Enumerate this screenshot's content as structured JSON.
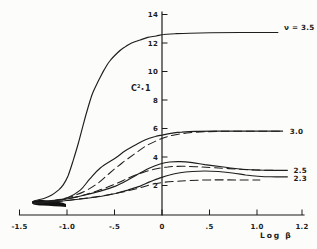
{
  "chart_data": {
    "type": "line",
    "title": "",
    "xlabel": "Log β",
    "ylabel": "C²•1",
    "ylabel_parts": {
      "base": "C",
      "exp": "2",
      "dot": "•",
      "suffix": "1"
    },
    "xlim": [
      -1.5,
      1.45
    ],
    "ylim": [
      0,
      14
    ],
    "grid": "off",
    "legend_position": "right-edge-labels",
    "line_color": "#1e1e1e",
    "x_ticks": [
      {
        "label": "-1.5",
        "value": -1.5
      },
      {
        "label": "-1.0",
        "value": -1.0
      },
      {
        "label": "-.5",
        "value": -0.5
      },
      {
        "label": "0",
        "value": 0
      },
      {
        "label": ".5",
        "value": 0.5
      },
      {
        "label": "1.0",
        "value": 1.0
      },
      {
        "label": "1.2",
        "value": 1.2
      }
    ],
    "y_ticks": [
      {
        "label": "2",
        "value": 2
      },
      {
        "label": "4",
        "value": 4
      },
      {
        "label": "6",
        "value": 6
      },
      {
        "label": "8",
        "value": 8
      },
      {
        "label": "10",
        "value": 10
      },
      {
        "label": "12",
        "value": 12
      },
      {
        "label": "14",
        "value": 14
      }
    ],
    "series": [
      {
        "name": "nu-3.5-solid",
        "label": "ν = 3.5",
        "style": "solid",
        "label_dx": 6,
        "label_dy": -2,
        "points": [
          [
            -1.35,
            0.91
          ],
          [
            -1.23,
            1.12
          ],
          [
            -1.16,
            1.33
          ],
          [
            -1.09,
            1.68
          ],
          [
            -1.04,
            2.04
          ],
          [
            -0.99,
            2.67
          ],
          [
            -0.94,
            3.65
          ],
          [
            -0.88,
            4.98
          ],
          [
            -0.83,
            6.25
          ],
          [
            -0.78,
            7.44
          ],
          [
            -0.73,
            8.49
          ],
          [
            -0.67,
            9.33
          ],
          [
            -0.61,
            10.11
          ],
          [
            -0.55,
            10.74
          ],
          [
            -0.47,
            11.3
          ],
          [
            -0.4,
            11.68
          ],
          [
            -0.32,
            12.0
          ],
          [
            -0.23,
            12.21
          ],
          [
            -0.15,
            12.39
          ],
          [
            -0.06,
            12.49
          ],
          [
            0.02,
            12.6
          ],
          [
            0.14,
            12.65
          ],
          [
            0.29,
            12.69
          ],
          [
            0.51,
            12.72
          ],
          [
            0.82,
            12.74
          ],
          [
            1.22,
            12.74
          ]
        ]
      },
      {
        "name": "nu-3.0-solid",
        "label": "3.0",
        "style": "solid",
        "label_dx": 7,
        "label_dy": 3,
        "points": [
          [
            -1.35,
            0.77
          ],
          [
            -1.18,
            0.91
          ],
          [
            -1.0,
            1.12
          ],
          [
            -0.86,
            1.68
          ],
          [
            -0.76,
            2.46
          ],
          [
            -0.65,
            3.23
          ],
          [
            -0.49,
            3.93
          ],
          [
            -0.39,
            4.42
          ],
          [
            -0.28,
            4.84
          ],
          [
            -0.18,
            5.19
          ],
          [
            -0.07,
            5.44
          ],
          [
            0.0,
            5.54
          ],
          [
            0.11,
            5.68
          ],
          [
            0.21,
            5.75
          ],
          [
            0.35,
            5.8
          ],
          [
            0.56,
            5.82
          ],
          [
            1.27,
            5.82
          ]
        ]
      },
      {
        "name": "nu-3.0-dashed",
        "label": "",
        "style": "dashed",
        "points": [
          [
            -1.28,
            0.77
          ],
          [
            -1.13,
            0.95
          ],
          [
            -0.97,
            1.19
          ],
          [
            -0.81,
            1.61
          ],
          [
            -0.67,
            2.18
          ],
          [
            -0.55,
            2.88
          ],
          [
            -0.42,
            3.58
          ],
          [
            -0.29,
            4.21
          ],
          [
            -0.17,
            4.77
          ],
          [
            -0.04,
            5.19
          ],
          [
            0.06,
            5.44
          ],
          [
            0.17,
            5.59
          ],
          [
            0.29,
            5.7
          ],
          [
            0.45,
            5.77
          ],
          [
            0.72,
            5.81
          ],
          [
            1.27,
            5.81
          ]
        ]
      },
      {
        "name": "nu-2.5-solid",
        "label": "2.5",
        "style": "solid",
        "label_dx": 6,
        "label_dy": 2.5,
        "points": [
          [
            -1.35,
            0.77
          ],
          [
            -1.18,
            0.91
          ],
          [
            -1.0,
            1.05
          ],
          [
            -0.81,
            1.33
          ],
          [
            -0.65,
            1.61
          ],
          [
            -0.49,
            1.96
          ],
          [
            -0.36,
            2.39
          ],
          [
            -0.23,
            2.88
          ],
          [
            -0.13,
            3.23
          ],
          [
            -0.02,
            3.51
          ],
          [
            0.08,
            3.65
          ],
          [
            0.19,
            3.68
          ],
          [
            0.32,
            3.61
          ],
          [
            0.45,
            3.47
          ],
          [
            0.61,
            3.33
          ],
          [
            0.77,
            3.19
          ],
          [
            0.93,
            3.1
          ],
          [
            1.08,
            3.07
          ],
          [
            1.32,
            3.07
          ]
        ]
      },
      {
        "name": "nu-2.5-dashed",
        "label": "",
        "style": "dashed",
        "points": [
          [
            -1.23,
            0.84
          ],
          [
            -1.05,
            1.02
          ],
          [
            -0.86,
            1.26
          ],
          [
            -0.67,
            1.65
          ],
          [
            -0.49,
            2.11
          ],
          [
            -0.34,
            2.56
          ],
          [
            -0.2,
            2.91
          ],
          [
            -0.07,
            3.16
          ],
          [
            0.06,
            3.3
          ],
          [
            0.21,
            3.35
          ],
          [
            0.38,
            3.31
          ],
          [
            0.56,
            3.24
          ],
          [
            0.77,
            3.16
          ],
          [
            0.98,
            3.09
          ],
          [
            1.19,
            3.07
          ]
        ]
      },
      {
        "name": "nu-2.3-solid",
        "label": "2.3",
        "style": "solid",
        "label_dx": 6,
        "label_dy": 4,
        "points": [
          [
            -1.35,
            0.74
          ],
          [
            -1.18,
            0.84
          ],
          [
            -1.0,
            0.95
          ],
          [
            -0.81,
            1.09
          ],
          [
            -0.65,
            1.23
          ],
          [
            -0.49,
            1.44
          ],
          [
            -0.36,
            1.68
          ],
          [
            -0.23,
            1.96
          ],
          [
            -0.13,
            2.25
          ],
          [
            -0.02,
            2.53
          ],
          [
            0.08,
            2.74
          ],
          [
            0.19,
            2.89
          ],
          [
            0.32,
            2.98
          ],
          [
            0.45,
            3.02
          ],
          [
            0.59,
            2.98
          ],
          [
            0.74,
            2.88
          ],
          [
            0.88,
            2.74
          ],
          [
            1.01,
            2.65
          ],
          [
            1.14,
            2.61
          ],
          [
            1.32,
            2.61
          ]
        ]
      },
      {
        "name": "nu-2.3-dashed",
        "label": "",
        "style": "dashed",
        "points": [
          [
            -1.13,
            0.84
          ],
          [
            -0.92,
            1.02
          ],
          [
            -0.71,
            1.19
          ],
          [
            -0.49,
            1.44
          ],
          [
            -0.28,
            1.75
          ],
          [
            -0.13,
            2.04
          ],
          [
            0.0,
            2.21
          ],
          [
            0.14,
            2.29
          ],
          [
            0.29,
            2.35
          ],
          [
            0.51,
            2.39
          ],
          [
            0.77,
            2.39
          ],
          [
            1.03,
            2.39
          ]
        ]
      }
    ]
  }
}
